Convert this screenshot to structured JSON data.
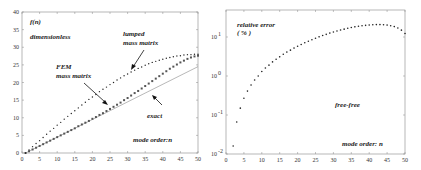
{
  "chart_data": [
    {
      "type": "scatter",
      "title": "",
      "xlabel": "mode order:n",
      "ylabel": "f(n) dimensionless",
      "xlim": [
        0,
        50
      ],
      "ylim": [
        0,
        40
      ],
      "xticks": [
        0,
        5,
        10,
        15,
        20,
        25,
        30,
        35,
        40,
        45,
        50
      ],
      "yticks": [
        0,
        5,
        10,
        15,
        20,
        25,
        30,
        35,
        40
      ],
      "grid": false,
      "annotations": [
        "f(n)",
        "dimensionless",
        "lumped mass matrix",
        "FEM mass matrix",
        "exact",
        "mode order:n"
      ],
      "series": [
        {
          "name": "lumped mass matrix",
          "style": "small dots",
          "x": [
            1,
            2,
            3,
            4,
            5,
            6,
            7,
            8,
            9,
            10,
            11,
            12,
            13,
            14,
            15,
            16,
            17,
            18,
            19,
            20,
            21,
            22,
            23,
            24,
            25,
            26,
            27,
            28,
            29,
            30,
            31,
            32,
            33,
            34,
            35,
            36,
            37,
            38,
            39,
            40,
            41,
            42,
            43,
            44,
            45,
            46,
            47,
            48,
            49,
            50
          ],
          "values": [
            0.0,
            0.9,
            1.8,
            2.7,
            3.5,
            4.4,
            5.3,
            6.2,
            7.0,
            7.9,
            8.7,
            9.6,
            10.4,
            11.2,
            12.0,
            12.8,
            13.6,
            14.4,
            15.2,
            15.9,
            16.6,
            17.4,
            18.1,
            18.7,
            19.4,
            20.0,
            20.7,
            21.3,
            21.9,
            22.4,
            23.0,
            23.5,
            24.0,
            24.4,
            24.9,
            25.3,
            25.7,
            26.0,
            26.3,
            26.6,
            26.9,
            27.1,
            27.3,
            27.5,
            27.6,
            27.8,
            27.9,
            27.9,
            28.0,
            28.0
          ]
        },
        {
          "name": "FEM mass matrix",
          "style": "square markers",
          "x": [
            1,
            2,
            3,
            4,
            5,
            6,
            7,
            8,
            9,
            10,
            11,
            12,
            13,
            14,
            15,
            16,
            17,
            18,
            19,
            20,
            21,
            22,
            23,
            24,
            25,
            26,
            27,
            28,
            29,
            30,
            31,
            32,
            33,
            34,
            35,
            36,
            37,
            38,
            39,
            40,
            41,
            42,
            43,
            44,
            45,
            46,
            47,
            48,
            49,
            50
          ],
          "values": [
            0.0,
            0.5,
            1.0,
            1.5,
            2.0,
            2.5,
            3.0,
            3.5,
            4.0,
            4.5,
            5.0,
            5.5,
            6.0,
            6.5,
            7.0,
            7.6,
            8.1,
            8.6,
            9.1,
            9.7,
            10.2,
            10.8,
            11.3,
            11.9,
            12.5,
            13.1,
            13.7,
            14.3,
            15.0,
            15.6,
            16.3,
            17.0,
            17.6,
            18.3,
            19.0,
            19.7,
            20.4,
            21.1,
            21.8,
            22.5,
            23.2,
            23.9,
            24.5,
            25.1,
            25.7,
            26.2,
            26.7,
            27.1,
            27.4,
            27.6
          ]
        },
        {
          "name": "exact",
          "style": "solid line",
          "x": [
            1,
            50
          ],
          "values": [
            0.0,
            24.5
          ]
        }
      ]
    },
    {
      "type": "scatter",
      "title": "",
      "xlabel": "mode order: n",
      "ylabel": "relative error (%)",
      "yscale": "log",
      "xlim": [
        0,
        50
      ],
      "ylim": [
        0.01,
        50
      ],
      "xticks": [
        0,
        5,
        10,
        15,
        20,
        25,
        30,
        35,
        40,
        45,
        50
      ],
      "yticks": [
        "10^-2",
        "10^-1",
        "10^0",
        "10^1"
      ],
      "grid": false,
      "annotations": [
        "relative error",
        "(%)",
        "free-free",
        "mode order: n"
      ],
      "series": [
        {
          "name": "relative error",
          "style": "dots",
          "x": [
            2,
            3,
            4,
            5,
            6,
            7,
            8,
            9,
            10,
            11,
            12,
            13,
            14,
            15,
            16,
            17,
            18,
            19,
            20,
            21,
            22,
            23,
            24,
            25,
            26,
            27,
            28,
            29,
            30,
            31,
            32,
            33,
            34,
            35,
            36,
            37,
            38,
            39,
            40,
            41,
            42,
            43,
            44,
            45,
            46,
            47,
            48,
            49,
            50
          ],
          "values": [
            0.016,
            0.066,
            0.15,
            0.27,
            0.41,
            0.59,
            0.79,
            1.0,
            1.3,
            1.6,
            1.9,
            2.3,
            2.7,
            3.1,
            3.6,
            4.1,
            4.6,
            5.2,
            5.8,
            6.4,
            7.1,
            7.8,
            8.5,
            9.3,
            10.1,
            10.9,
            11.7,
            12.6,
            13.4,
            14.3,
            15.1,
            15.9,
            16.7,
            17.5,
            18.2,
            18.8,
            19.4,
            19.9,
            20.3,
            20.6,
            20.8,
            20.8,
            20.6,
            20.2,
            19.5,
            18.5,
            17.0,
            15.0,
            12.3
          ]
        }
      ]
    }
  ],
  "left": {
    "ylabel_line1": "f(n)",
    "ylabel_line2": "dimensionless",
    "lumped_line1": "lumped",
    "lumped_line2": "mass matrix",
    "fem_line1": "FEM",
    "fem_line2": "mass matrix",
    "exact": "exact",
    "xlabel": "mode order:n",
    "xticks": [
      "0",
      "5",
      "10",
      "15",
      "20",
      "25",
      "30",
      "35",
      "40",
      "45",
      "50"
    ],
    "yticks": [
      "0",
      "5",
      "10",
      "15",
      "20",
      "25",
      "30",
      "35",
      "40"
    ]
  },
  "right": {
    "ylabel_line1": "relative error",
    "ylabel_line2": "( % )",
    "case": "free-free",
    "xlabel": "mode order: n",
    "xticks": [
      "0",
      "5",
      "10",
      "15",
      "20",
      "25",
      "30",
      "35",
      "40",
      "45",
      "50"
    ],
    "yticks": [
      {
        "base": "10",
        "exp": "-2"
      },
      {
        "base": "10",
        "exp": "-1"
      },
      {
        "base": "10",
        "exp": "0"
      },
      {
        "base": "10",
        "exp": "1"
      }
    ]
  }
}
